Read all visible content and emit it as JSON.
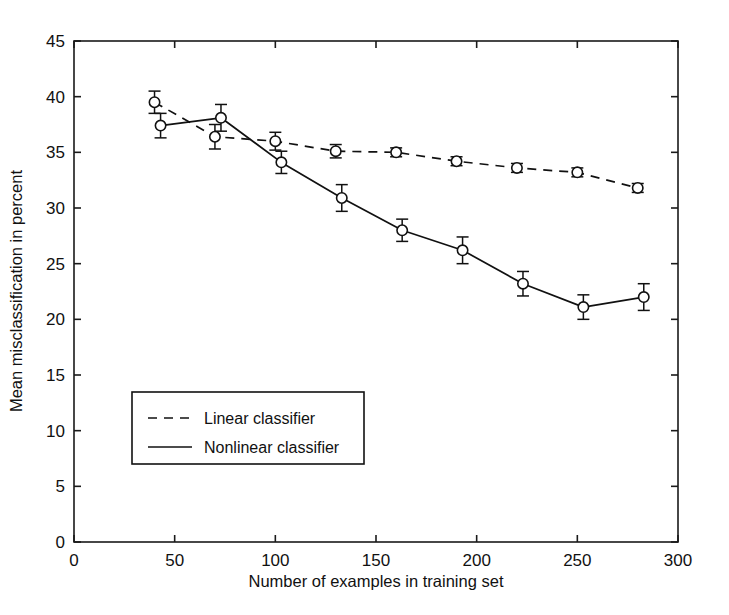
{
  "chart_data": {
    "type": "line",
    "title": "",
    "xlabel": "Number of examples in training set",
    "ylabel": "Mean misclassification in percent",
    "xlim": [
      0,
      300
    ],
    "ylim": [
      0,
      45
    ],
    "xticks": [
      0,
      50,
      100,
      150,
      200,
      250,
      300
    ],
    "yticks": [
      0,
      5,
      10,
      15,
      20,
      25,
      30,
      35,
      40,
      45
    ],
    "grid": false,
    "legend_position": "lower-left-inside",
    "marker": "circle-open",
    "error_bars": "vertical-with-caps",
    "series": [
      {
        "name": "Linear classifier",
        "linestyle": "dashed",
        "color": "#111111",
        "x": [
          40,
          70,
          100,
          130,
          160,
          190,
          220,
          250,
          280
        ],
        "values": [
          39.5,
          36.4,
          36.0,
          35.1,
          35.0,
          34.2,
          33.6,
          33.2,
          31.8
        ],
        "errors": [
          1.0,
          1.1,
          0.8,
          0.6,
          0.4,
          0.4,
          0.4,
          0.4,
          0.4
        ]
      },
      {
        "name": "Nonlinear classifier",
        "linestyle": "solid",
        "color": "#111111",
        "x": [
          43,
          73,
          103,
          133,
          163,
          193,
          223,
          253,
          283
        ],
        "values": [
          37.4,
          38.1,
          34.1,
          30.9,
          28.0,
          26.2,
          23.2,
          21.1,
          22.0
        ],
        "errors": [
          1.1,
          1.2,
          1.0,
          1.2,
          1.0,
          1.2,
          1.1,
          1.1,
          1.2
        ]
      }
    ]
  },
  "legend": {
    "items": [
      {
        "label": "Linear classifier",
        "style": "dashed"
      },
      {
        "label": "Nonlinear classifier",
        "style": "solid"
      }
    ]
  },
  "axes": {
    "x_title": "Number of examples in training set",
    "y_title": "Mean misclassification in percent",
    "x_tick_labels": [
      "0",
      "50",
      "100",
      "150",
      "200",
      "250",
      "300"
    ],
    "y_tick_labels": [
      "0",
      "5",
      "10",
      "15",
      "20",
      "25",
      "30",
      "35",
      "40",
      "45"
    ]
  }
}
